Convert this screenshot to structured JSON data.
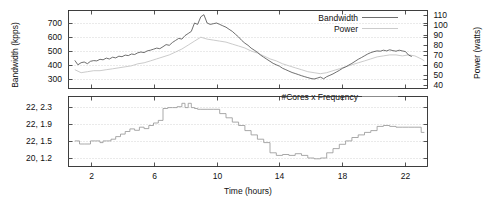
{
  "chart_data": {
    "type": "line",
    "title": "",
    "xlabel": "Time (hours)",
    "xlim": [
      0.6,
      23.4
    ],
    "xticks": [
      2,
      6,
      10,
      14,
      18,
      22
    ],
    "xticklabels": [
      "2",
      "6",
      "10",
      "14",
      "18",
      "22"
    ],
    "panels": [
      {
        "name": "bandwidth-power-panel",
        "ylabel_left": "Bandwidth (kpps)",
        "ylabel_right": "Power (watts)",
        "ylim_left": [
          230,
          790
        ],
        "yticks_left": [
          300,
          400,
          500,
          600,
          700
        ],
        "yticklabels_left": [
          "300",
          "400",
          "500",
          "600",
          "700"
        ],
        "ylim_right": [
          36,
          115
        ],
        "yticks_right": [
          40,
          50,
          60,
          70,
          80,
          90,
          100,
          110
        ],
        "yticklabels_right": [
          "40",
          "50",
          "60",
          "70",
          "80",
          "90",
          "100",
          "110"
        ],
        "legend": [
          {
            "label": "Bandwidth",
            "color": "#555555"
          },
          {
            "label": "Power",
            "color": "#c2c2c2"
          }
        ],
        "series": [
          {
            "name": "Bandwidth",
            "axis": "left",
            "unit": "kpps",
            "x": [
              1.0,
              1.2,
              1.4,
              1.6,
              1.8,
              2.0,
              2.2,
              2.4,
              2.6,
              2.8,
              3.0,
              3.2,
              3.4,
              3.6,
              3.8,
              4.0,
              4.2,
              4.4,
              4.6,
              4.8,
              5.0,
              5.2,
              5.4,
              5.6,
              5.8,
              6.0,
              6.2,
              6.4,
              6.6,
              6.8,
              7.0,
              7.2,
              7.4,
              7.6,
              7.8,
              8.0,
              8.2,
              8.4,
              8.6,
              8.8,
              9.0,
              9.2,
              9.4,
              9.6,
              9.8,
              10.0,
              10.2,
              10.4,
              10.6,
              10.8,
              11.0,
              11.2,
              11.4,
              11.6,
              11.8,
              12.0,
              12.2,
              12.4,
              12.6,
              12.8,
              13.0,
              13.2,
              13.4,
              13.6,
              13.8,
              14.0,
              14.2,
              14.4,
              14.6,
              14.8,
              15.0,
              15.2,
              15.4,
              15.6,
              15.8,
              16.0,
              16.2,
              16.4,
              16.6,
              16.8,
              17.0,
              17.2,
              17.4,
              17.6,
              17.8,
              18.0,
              18.2,
              18.4,
              18.6,
              18.8,
              19.0,
              19.2,
              19.4,
              19.6,
              19.8,
              20.0,
              20.2,
              20.4,
              20.6,
              20.8,
              21.0,
              21.2,
              21.4,
              21.6,
              21.8,
              22.0,
              22.2,
              22.4,
              22.6,
              22.8,
              23.0,
              23.2
            ],
            "y": [
              432,
              400,
              415,
              420,
              408,
              425,
              430,
              428,
              440,
              436,
              448,
              442,
              455,
              450,
              462,
              458,
              470,
              466,
              478,
              474,
              486,
              492,
              488,
              500,
              505,
              512,
              520,
              516,
              530,
              545,
              540,
              560,
              575,
              590,
              585,
              610,
              625,
              640,
              700,
              690,
              745,
              760,
              700,
              690,
              695,
              700,
              690,
              680,
              670,
              655,
              640,
              620,
              600,
              575,
              555,
              540,
              520,
              505,
              490,
              470,
              455,
              440,
              425,
              410,
              400,
              390,
              375,
              365,
              355,
              345,
              338,
              330,
              322,
              315,
              308,
              302,
              298,
              305,
              312,
              300,
              315,
              325,
              335,
              348,
              360,
              375,
              385,
              398,
              410,
              425,
              440,
              452,
              465,
              478,
              488,
              495,
              500,
              498,
              505,
              500,
              508,
              502,
              498,
              505,
              500,
              495,
              470,
              460
            ]
          },
          {
            "name": "Power",
            "axis": "right",
            "unit": "watts",
            "x": [
              1.0,
              1.4,
              1.8,
              2.2,
              2.6,
              3.0,
              3.4,
              3.8,
              4.2,
              4.6,
              5.0,
              5.4,
              5.8,
              6.2,
              6.6,
              7.0,
              7.4,
              7.8,
              8.2,
              8.6,
              9.0,
              9.4,
              9.8,
              10.2,
              10.6,
              11.0,
              11.4,
              11.8,
              12.2,
              12.6,
              13.0,
              13.4,
              13.8,
              14.2,
              14.6,
              15.0,
              15.4,
              15.8,
              16.2,
              16.6,
              17.0,
              17.4,
              17.8,
              18.2,
              18.6,
              19.0,
              19.4,
              19.8,
              20.2,
              20.6,
              21.0,
              21.4,
              21.8,
              22.2,
              22.6,
              23.0,
              23.2
            ],
            "y": [
              55,
              52,
              53,
              54,
              54,
              55,
              56,
              57,
              58,
              59,
              61,
              62,
              64,
              66,
              68,
              70,
              73,
              76,
              80,
              84,
              88,
              86,
              85,
              84,
              83,
              81,
              79,
              77,
              74,
              72,
              69,
              66,
              64,
              61,
              59,
              57,
              55,
              53,
              52,
              51,
              52,
              54,
              56,
              58,
              60,
              62,
              64,
              66,
              68,
              69,
              70,
              70,
              69,
              70,
              69,
              66,
              64
            ]
          }
        ]
      },
      {
        "name": "cores-frequency-panel",
        "ylim": [
          0.5,
          4.6
        ],
        "yticks": [
          4,
          3,
          2,
          1
        ],
        "yticklabels": [
          "22, 2.3",
          "22, 1.9",
          "22, 1.5",
          "20, 1.2"
        ],
        "legend": [
          {
            "label": "#Cores x Frequency",
            "color": "#9a9a9a"
          }
        ],
        "series": [
          {
            "name": "#Cores x Frequency",
            "step": true,
            "x": [
              1.0,
              1.3,
              1.6,
              2.0,
              2.3,
              2.6,
              2.8,
              3.0,
              3.3,
              3.6,
              3.9,
              4.2,
              4.5,
              4.8,
              5.1,
              5.4,
              5.7,
              6.0,
              6.3,
              6.6,
              6.9,
              7.2,
              7.5,
              7.8,
              8.0,
              8.2,
              8.4,
              8.6,
              8.8,
              9.0,
              9.4,
              9.8,
              10.2,
              10.6,
              11.0,
              11.4,
              11.8,
              12.2,
              12.6,
              13.0,
              13.4,
              13.8,
              14.2,
              14.6,
              15.0,
              15.4,
              15.8,
              16.2,
              16.6,
              17.0,
              17.4,
              17.8,
              18.2,
              18.6,
              19.0,
              19.4,
              19.8,
              20.2,
              20.6,
              21.0,
              21.4,
              21.8,
              22.2,
              22.6,
              23.0,
              23.2
            ],
            "y": [
              2.0,
              1.82,
              1.82,
              2.0,
              2.0,
              1.9,
              2.0,
              2.0,
              2.1,
              2.25,
              2.4,
              2.55,
              2.7,
              2.62,
              2.8,
              2.72,
              2.9,
              3.05,
              3.2,
              3.9,
              3.95,
              3.95,
              4.0,
              4.2,
              3.95,
              4.2,
              3.95,
              3.9,
              3.85,
              3.85,
              3.85,
              3.85,
              3.6,
              3.35,
              3.1,
              2.9,
              2.6,
              2.35,
              2.1,
              1.9,
              1.3,
              1.15,
              1.2,
              1.15,
              1.25,
              1.15,
              1.0,
              0.95,
              1.0,
              1.3,
              1.55,
              1.8,
              2.0,
              2.2,
              2.35,
              2.5,
              2.6,
              2.85,
              2.9,
              2.85,
              2.8,
              2.8,
              2.8,
              2.8,
              2.5,
              2.5
            ]
          }
        ]
      }
    ]
  }
}
